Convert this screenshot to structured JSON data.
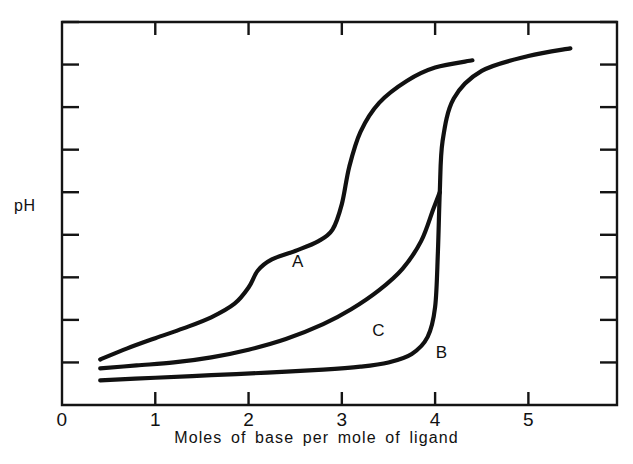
{
  "chart_data": {
    "type": "line",
    "title": "",
    "xlabel": "Moles of base per mole of ligand",
    "ylabel": "pH",
    "xlim": [
      0,
      5.95
    ],
    "ylim": [
      0,
      9
    ],
    "grid": false,
    "legend_position": "inline-curve-labels",
    "x_ticks": [
      0,
      1,
      2,
      3,
      4,
      5
    ],
    "x_tick_labels": [
      "0",
      "1",
      "2",
      "3",
      "4",
      "5"
    ],
    "y_ticks": [
      1,
      2,
      3,
      4,
      5,
      6,
      7,
      8,
      9
    ],
    "y_tick_labels": [
      "",
      "",
      "",
      "",
      "",
      "",
      "",
      "",
      ""
    ],
    "series": [
      {
        "name": "A",
        "label": "A",
        "label_x": 2.52,
        "label_y": 3.35,
        "points": [
          [
            0.41,
            1.07
          ],
          [
            0.7,
            1.33
          ],
          [
            1.0,
            1.57
          ],
          [
            1.3,
            1.8
          ],
          [
            1.6,
            2.06
          ],
          [
            1.85,
            2.38
          ],
          [
            2.0,
            2.76
          ],
          [
            2.1,
            3.16
          ],
          [
            2.25,
            3.42
          ],
          [
            2.5,
            3.62
          ],
          [
            2.75,
            3.85
          ],
          [
            2.9,
            4.12
          ],
          [
            3.0,
            4.72
          ],
          [
            3.08,
            5.6
          ],
          [
            3.2,
            6.42
          ],
          [
            3.4,
            7.1
          ],
          [
            3.7,
            7.62
          ],
          [
            4.0,
            7.93
          ],
          [
            4.4,
            8.1
          ]
        ]
      },
      {
        "name": "B",
        "label": "B",
        "label_x": 4.06,
        "label_y": 1.22,
        "points": [
          [
            0.41,
            0.58
          ],
          [
            1.0,
            0.64
          ],
          [
            1.6,
            0.7
          ],
          [
            2.2,
            0.76
          ],
          [
            2.8,
            0.83
          ],
          [
            3.2,
            0.9
          ],
          [
            3.5,
            1.0
          ],
          [
            3.75,
            1.2
          ],
          [
            3.92,
            1.6
          ],
          [
            4.0,
            2.3
          ],
          [
            4.03,
            3.6
          ],
          [
            4.05,
            5.0
          ],
          [
            4.08,
            6.2
          ],
          [
            4.2,
            7.2
          ],
          [
            4.5,
            7.85
          ],
          [
            5.0,
            8.2
          ],
          [
            5.45,
            8.38
          ]
        ]
      },
      {
        "name": "C",
        "label": "C",
        "label_x": 3.38,
        "label_y": 1.73,
        "points": [
          [
            0.41,
            0.86
          ],
          [
            0.8,
            0.93
          ],
          [
            1.2,
            1.0
          ],
          [
            1.6,
            1.12
          ],
          [
            2.0,
            1.3
          ],
          [
            2.4,
            1.55
          ],
          [
            2.8,
            1.9
          ],
          [
            3.1,
            2.25
          ],
          [
            3.4,
            2.7
          ],
          [
            3.65,
            3.2
          ],
          [
            3.85,
            3.85
          ],
          [
            3.98,
            4.6
          ],
          [
            4.05,
            5.0
          ]
        ]
      }
    ]
  }
}
